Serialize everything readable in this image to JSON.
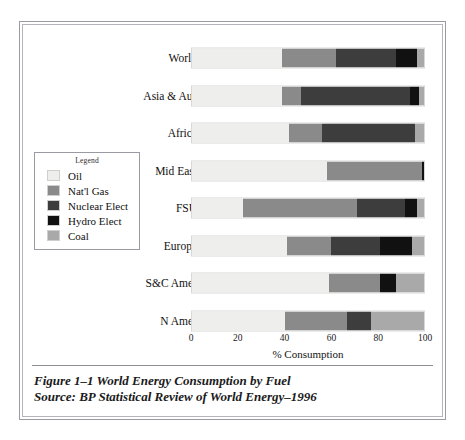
{
  "chart_data": {
    "type": "bar",
    "orientation": "horizontal",
    "stacked": true,
    "title": "World Energy Consumption by Fuel",
    "xlabel": "% Consumption",
    "ylabel": "",
    "xlim": [
      0,
      100
    ],
    "xticks": [
      0,
      20,
      40,
      60,
      80,
      100
    ],
    "grid": false,
    "legend_position": "left-middle",
    "legend_title": "Legend",
    "categories": [
      "World",
      "Asia & Aus",
      "Africa",
      "Mid East",
      "FSU",
      "Europe",
      "S&C Amer",
      "N Amer"
    ],
    "series": [
      {
        "name": "Oil",
        "color": "#eeeeec",
        "values": [
          39,
          39,
          42,
          58,
          22,
          41,
          59,
          40
        ]
      },
      {
        "name": "Nat'l Gas",
        "color": "#8a8a8a",
        "values": [
          23,
          8,
          14,
          41,
          49,
          19,
          22,
          27
        ]
      },
      {
        "name": "Nuclear Elect",
        "color": "#3d3d3d",
        "values": [
          26,
          47,
          40,
          0,
          21,
          21,
          0,
          10
        ]
      },
      {
        "name": "Hydro Elect",
        "color": "#111111",
        "values": [
          9,
          4,
          0,
          1,
          5,
          14,
          7,
          0
        ]
      },
      {
        "name": "Coal",
        "color": "#a9a9a9",
        "values": [
          3,
          2,
          4,
          0,
          3,
          5,
          12,
          23
        ]
      }
    ]
  },
  "legend": {
    "title": "Legend",
    "items": [
      {
        "label": "Oil",
        "color": "#eeeeec"
      },
      {
        "label": "Nat'l Gas",
        "color": "#8a8a8a"
      },
      {
        "label": "Nuclear Elect",
        "color": "#3d3d3d"
      },
      {
        "label": "Hydro Elect",
        "color": "#111111"
      },
      {
        "label": "Coal",
        "color": "#a9a9a9"
      }
    ]
  },
  "axis": {
    "title": "% Consumption",
    "ticks": [
      "0",
      "20",
      "40",
      "60",
      "80",
      "100"
    ]
  },
  "caption": {
    "line1": "Figure 1–1 World Energy Consumption by Fuel",
    "line2": "Source: BP Statistical Review of World Energy–1996"
  }
}
